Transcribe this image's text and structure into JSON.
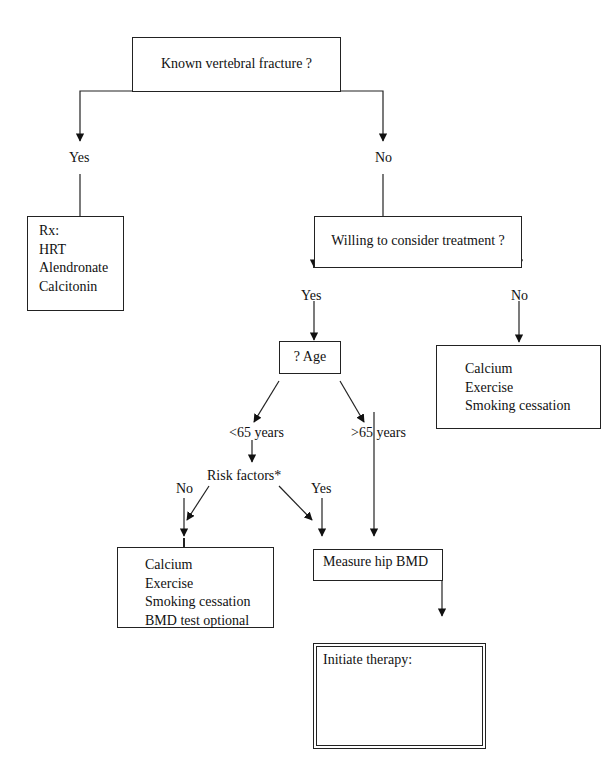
{
  "flowchart": {
    "root": {
      "label": "Known vertebral fracture ?"
    },
    "branch_yes_1": {
      "label": "Yes"
    },
    "branch_no_1": {
      "label": "No"
    },
    "rx_box": {
      "lines": [
        "Rx:",
        "HRT",
        "Alendronate",
        "Calcitonin"
      ]
    },
    "treatment_question": {
      "label": "Willing to consider treatment ?"
    },
    "branch_yes_2": {
      "label": "Yes"
    },
    "branch_no_2": {
      "label": "No"
    },
    "lifestyle_box": {
      "lines": [
        "Calcium",
        "Exercise",
        "Smoking cessation"
      ]
    },
    "age_box": {
      "label": "? Age"
    },
    "age_under": {
      "label": "<65 years"
    },
    "age_over": {
      "label": ">65 years"
    },
    "risk_factors": {
      "label": "Risk factors*"
    },
    "branch_no_3": {
      "label": "No"
    },
    "branch_yes_3": {
      "label": "Yes"
    },
    "lifestyle_box_2": {
      "lines": [
        "Calcium",
        "Exercise",
        "Smoking cessation",
        "BMD test optional"
      ]
    },
    "measure_box": {
      "label": "Measure hip BMD"
    },
    "therapy_box": {
      "title": "Initiate therapy:",
      "cond1_line1": "if T score –2 with absence",
      "cond1_line2": "of other risk factors,",
      "or": "or",
      "cond2_line1": "if T score below –1.5",
      "cond2_line2": "with other risk factors",
      "cond2_line3": "present"
    }
  }
}
